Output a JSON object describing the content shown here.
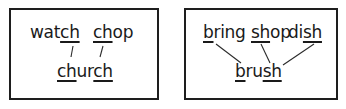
{
  "panels": [
    {
      "top_words": [
        {
          "pre": "wat",
          "u": "ch",
          "post": ""
        },
        {
          "pre": "",
          "u": "ch",
          "post": "op"
        }
      ],
      "bottom_word": {
        "parts": [
          {
            "pre": "",
            "u": "ch",
            "post": "ur"
          },
          {
            "pre": "",
            "u": "ch",
            "post": ""
          }
        ]
      }
    },
    {
      "top_words": [
        {
          "pre": "",
          "u": "b",
          "post": "ring"
        },
        {
          "pre": "",
          "u": "sh",
          "post": "op"
        },
        {
          "pre": "di",
          "u": "sh",
          "post": ""
        }
      ],
      "bottom_word": {
        "parts": [
          {
            "pre": "",
            "u": "b",
            "post": "ru"
          },
          {
            "pre": "",
            "u": "sh",
            "post": ""
          }
        ]
      }
    }
  ],
  "colors": {
    "ink": "#1a1a1a",
    "border": "#1e1e1e",
    "background": "#ffffff"
  }
}
